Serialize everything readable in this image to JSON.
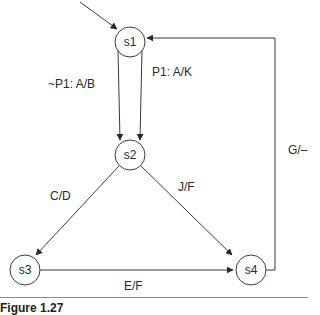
{
  "diagram": {
    "type": "state-machine",
    "states": [
      {
        "id": "s1",
        "label": "s1",
        "initial": true
      },
      {
        "id": "s2",
        "label": "s2"
      },
      {
        "id": "s3",
        "label": "s3"
      },
      {
        "id": "s4",
        "label": "s4"
      }
    ],
    "transitions": [
      {
        "from": "s1",
        "to": "s2",
        "label": "~P1: A/B"
      },
      {
        "from": "s1",
        "to": "s2",
        "label": "P1: A/K"
      },
      {
        "from": "s2",
        "to": "s3",
        "label": "C/D"
      },
      {
        "from": "s2",
        "to": "s4",
        "label": "J/F"
      },
      {
        "from": "s3",
        "to": "s4",
        "label": "E/F"
      },
      {
        "from": "s4",
        "to": "s1",
        "label": "G/–"
      }
    ],
    "caption": "Figure 1.27"
  }
}
